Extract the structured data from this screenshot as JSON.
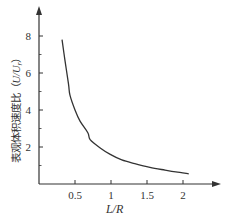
{
  "chart_data": {
    "type": "line",
    "title": "",
    "xlabel": "L/R",
    "ylabel": "表观体积速度比（U/U_r）",
    "ylabel_parts": {
      "text": "表观体积速度比（",
      "var": "U/U",
      "sub": "r",
      "close": "）"
    },
    "xlim": [
      0,
      2.4
    ],
    "ylim": [
      0,
      9.5
    ],
    "x_ticks": [
      0.5,
      1,
      1.5,
      2
    ],
    "x_tick_labels": [
      "0.5",
      "1",
      "1.5",
      "2"
    ],
    "y_ticks": [
      2,
      4,
      6,
      8
    ],
    "y_tick_labels": [
      "2",
      "4",
      "6",
      "8"
    ],
    "y_minor_ticks": [
      1,
      3,
      5,
      7
    ],
    "grid": false,
    "legend": null,
    "series": [
      {
        "name": "U/U_r vs L/R",
        "color": "#333333",
        "x": [
          0.32,
          0.36,
          0.41,
          0.43,
          0.5,
          0.57,
          0.68,
          0.71,
          0.85,
          0.99,
          1.15,
          1.33,
          1.54,
          1.75,
          1.9,
          2.08
        ],
        "y": [
          7.8,
          6.7,
          5.4,
          4.8,
          4.0,
          3.4,
          2.76,
          2.4,
          1.95,
          1.6,
          1.3,
          1.1,
          0.9,
          0.75,
          0.65,
          0.55
        ]
      }
    ]
  }
}
